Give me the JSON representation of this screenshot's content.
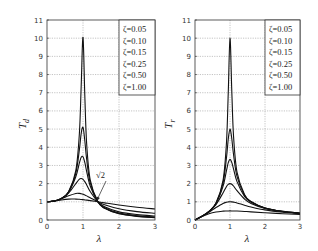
{
  "chart_data": [
    {
      "type": "line",
      "title": "",
      "xlabel": "λ",
      "ylabel": "T_d",
      "ylabel_main": "T",
      "ylabel_sub": "d",
      "xlim": [
        0,
        3
      ],
      "ylim": [
        0,
        11
      ],
      "xticks": [
        0,
        1,
        2,
        3
      ],
      "yticks": [
        0,
        1,
        2,
        3,
        4,
        5,
        6,
        7,
        8,
        9,
        10,
        11
      ],
      "grid": true,
      "legend_position": "upper right",
      "annotation": {
        "text": "√2",
        "x": 1.414,
        "y": 1
      },
      "x": [
        0,
        0.2,
        0.4,
        0.6,
        0.8,
        0.9,
        0.95,
        1.0,
        1.05,
        1.1,
        1.2,
        1.414,
        1.6,
        2.0,
        2.5,
        3.0
      ],
      "series": [
        {
          "name": "ζ=0.05",
          "values": [
            1,
            1.042,
            1.19,
            1.558,
            2.72,
            4.776,
            7.38,
            10.05,
            6.86,
            4.244,
            2.208,
            1,
            0.646,
            0.339,
            0.196,
            0.13
          ]
        },
        {
          "name": "ζ=0.10",
          "values": [
            1,
            1.042,
            1.189,
            1.547,
            2.571,
            3.882,
            4.767,
            5.099,
            4.373,
            3.367,
            2.052,
            1,
            0.659,
            0.356,
            0.212,
            0.145
          ]
        },
        {
          "name": "ζ=0.15",
          "values": [
            1,
            1.042,
            1.187,
            1.528,
            2.377,
            3.137,
            3.453,
            3.48,
            3.166,
            2.692,
            1.87,
            1,
            0.68,
            0.381,
            0.236,
            0.167
          ]
        },
        {
          "name": "ζ=0.25",
          "values": [
            1,
            1.041,
            1.181,
            1.477,
            2.001,
            2.245,
            2.283,
            2.236,
            2.112,
            1.939,
            1.567,
            1,
            0.73,
            0.447,
            0.297,
            0.221
          ]
        },
        {
          "name": "ζ=0.50",
          "values": [
            1,
            1.04,
            1.158,
            1.329,
            1.46,
            1.463,
            1.444,
            1.414,
            1.374,
            1.327,
            1.222,
            1,
            0.844,
            0.62,
            0.463,
            0.37
          ]
        },
        {
          "name": "ζ=1.00",
          "values": [
            1,
            1.036,
            1.104,
            1.149,
            1.15,
            1.138,
            1.129,
            1.118,
            1.106,
            1.094,
            1.066,
            1,
            0.942,
            0.825,
            0.703,
            0.608
          ]
        }
      ]
    },
    {
      "type": "line",
      "title": "",
      "xlabel": "λ",
      "ylabel": "T_r",
      "ylabel_main": "T",
      "ylabel_sub": "r",
      "xlim": [
        0,
        3
      ],
      "ylim": [
        0,
        11
      ],
      "xticks": [
        0,
        1,
        2,
        3
      ],
      "yticks": [
        0,
        1,
        2,
        3,
        4,
        5,
        6,
        7,
        8,
        9,
        10,
        11
      ],
      "grid": true,
      "legend_position": "upper right",
      "x": [
        0,
        0.2,
        0.4,
        0.6,
        0.8,
        0.9,
        0.95,
        1.0,
        1.05,
        1.1,
        1.2,
        1.414,
        1.6,
        2.0,
        2.5,
        3.0
      ],
      "series": [
        {
          "name": "ζ=0.05",
          "values": [
            0,
            0.208,
            0.476,
            0.933,
            2.169,
            4.281,
            6.985,
            10,
            7.16,
            4.64,
            2.631,
            1.4,
            1.02,
            0.665,
            0.476,
            0.375
          ]
        },
        {
          "name": "ζ=0.10",
          "values": [
            0,
            0.208,
            0.474,
            0.921,
            2.031,
            3.439,
            4.449,
            5,
            4.493,
            3.617,
            2.394,
            1.361,
            1.005,
            0.661,
            0.474,
            0.374
          ]
        },
        {
          "name": "ζ=0.15",
          "values": [
            0,
            0.208,
            0.471,
            0.902,
            1.849,
            2.726,
            3.154,
            3.333,
            3.17,
            2.812,
            2.111,
            1.302,
            0.98,
            0.654,
            0.471,
            0.373
          ]
        },
        {
          "name": "ζ=0.25",
          "values": [
            0,
            0.207,
            0.463,
            0.849,
            1.487,
            1.842,
            1.959,
            2.0,
            1.963,
            1.869,
            1.613,
            1.155,
            0.913,
            0.632,
            0.463,
            0.369
          ]
        },
        {
          "name": "ζ=0.50",
          "values": [
            0,
            0.204,
            0.43,
            0.684,
            0.912,
            0.978,
            0.995,
            1.0,
            0.995,
            0.982,
            0.939,
            0.816,
            0.716,
            0.555,
            0.43,
            0.351
          ]
        },
        {
          "name": "ζ=1.00",
          "values": [
            0,
            0.192,
            0.345,
            0.441,
            0.488,
            0.497,
            0.499,
            0.5,
            0.499,
            0.498,
            0.492,
            0.471,
            0.449,
            0.4,
            0.345,
            0.3
          ]
        }
      ]
    }
  ],
  "panels": [
    {
      "ylabel_main": "T",
      "ylabel_sub": "d",
      "xlabel": "λ",
      "legend": [
        "ζ=0.05",
        "ζ=0.10",
        "ζ=0.15",
        "ζ=0.25",
        "ζ=0.50",
        "ζ=1.00"
      ],
      "annotation": "√2"
    },
    {
      "ylabel_main": "T",
      "ylabel_sub": "r",
      "xlabel": "λ",
      "legend": [
        "ζ=0.05",
        "ζ=0.10",
        "ζ=0.15",
        "ζ=0.25",
        "ζ=0.50",
        "ζ=1.00"
      ]
    }
  ]
}
